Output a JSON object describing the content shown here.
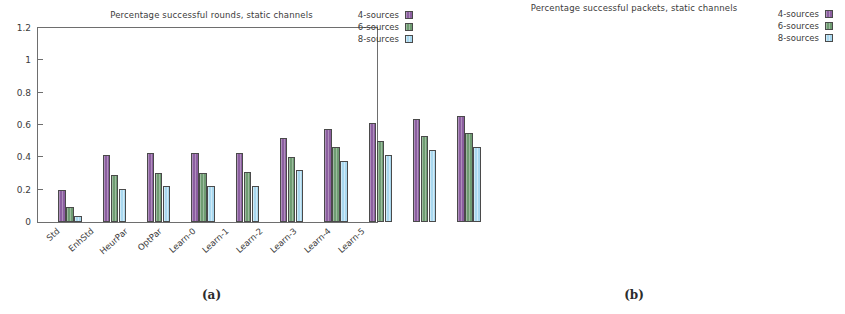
{
  "figure": {
    "panels": [
      {
        "key": "a",
        "subcaption": "(a)",
        "title": "Percentage successful rounds, static channels"
      },
      {
        "key": "b",
        "subcaption": "(b)",
        "title": "Percentage successful packets, static channels"
      }
    ]
  },
  "legend": {
    "items": [
      {
        "label": "4-sources",
        "color": "#8c5fa0"
      },
      {
        "label": "6-sources",
        "color": "#6f9c72"
      },
      {
        "label": "8-sources",
        "color": "#a9d8ef"
      }
    ]
  },
  "chart_data": [
    {
      "type": "bar",
      "panel": "a",
      "title": "Percentage successful rounds, static channels",
      "xlabel": "",
      "ylabel": "",
      "ylim": [
        0,
        1.2
      ],
      "yticks": [
        0,
        0.2,
        0.4,
        0.6,
        0.8,
        1,
        1.2
      ],
      "ytick_labels": [
        "0",
        "0.2",
        "0.4",
        "0.6",
        "0.8",
        "1",
        "1.2"
      ],
      "grid": false,
      "legend_position": "top-right",
      "categories": [
        "Std",
        "EnhStd",
        "HeurPar",
        "OptPar",
        "Learn-0",
        "Learn-1",
        "Learn-2",
        "Learn-3",
        "Learn-4",
        "Learn-5"
      ],
      "series": [
        {
          "name": "4-sources",
          "color": "#8c5fa0",
          "values": [
            0.2,
            0.415,
            0.425,
            0.425,
            0.425,
            0.52,
            0.575,
            0.61,
            0.635,
            0.655
          ]
        },
        {
          "name": "6-sources",
          "color": "#6f9c72",
          "values": [
            0.09,
            0.29,
            0.305,
            0.305,
            0.31,
            0.405,
            0.465,
            0.5,
            0.53,
            0.55
          ]
        },
        {
          "name": "8-sources",
          "color": "#a9d8ef",
          "values": [
            0.04,
            0.205,
            0.22,
            0.22,
            0.225,
            0.32,
            0.375,
            0.415,
            0.445,
            0.465
          ]
        }
      ]
    },
    {
      "type": "bar",
      "panel": "b",
      "title": "Percentage successful packets, static channels",
      "xlabel": "",
      "ylabel": "",
      "ylim": [
        0,
        1.2
      ],
      "yticks": [
        0,
        0.2,
        0.4,
        0.6,
        0.8,
        1,
        1.2
      ],
      "ytick_labels": [
        "0",
        "0.2",
        "0.4",
        "0.6",
        "0.8",
        "1",
        "1.2"
      ],
      "grid": false,
      "legend_position": "top-right",
      "categories": [
        "Std",
        "EnhStd",
        "HeurPar",
        "OptPar",
        "Learn-0",
        "Learn-1",
        "Learn-2",
        "Learn-3",
        "Learn-4",
        "Learn-5"
      ],
      "series": [
        {
          "name": "4-sources",
          "color": "#8c5fa0",
          "values": [
            0.663,
            0.777,
            0.772,
            0.772,
            0.772,
            0.822,
            0.848,
            0.865,
            0.878,
            0.888
          ]
        },
        {
          "name": "6-sources",
          "color": "#6f9c72",
          "values": [
            0.665,
            0.785,
            0.778,
            0.778,
            0.778,
            0.828,
            0.853,
            0.872,
            0.883,
            0.893
          ]
        },
        {
          "name": "8-sources",
          "color": "#a9d8ef",
          "values": [
            0.667,
            0.79,
            0.785,
            0.785,
            0.785,
            0.833,
            0.858,
            0.877,
            0.888,
            0.898
          ]
        }
      ]
    }
  ]
}
